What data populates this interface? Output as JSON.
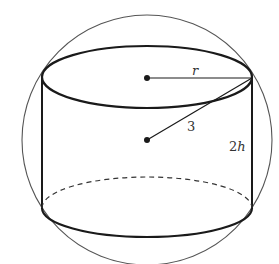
{
  "diagram": {
    "labels": {
      "radius": "r",
      "sphere_radius": "3",
      "height_num": "2",
      "height_var": "h"
    },
    "colors": {
      "stroke": "#1a1a1a",
      "sphere_stroke": "#555555",
      "background": "#ffffff"
    },
    "geometry": {
      "sphere_center": [
        147,
        140
      ],
      "sphere_radius_px": 125,
      "cylinder_left_x": 42,
      "cylinder_right_x": 252,
      "top_ellipse_cy": 77,
      "bottom_ellipse_cy": 208,
      "ellipse_ry": 30
    }
  }
}
